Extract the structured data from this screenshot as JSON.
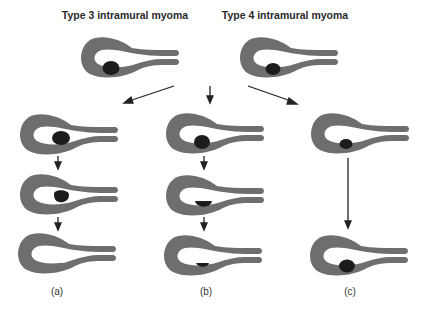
{
  "titles": {
    "type3": "Type 3 intramural myoma",
    "type4": "Type 4 intramural myoma"
  },
  "labels": {
    "a": "(a)",
    "b": "(b)",
    "c": "(c)"
  },
  "colors": {
    "uterus": "#6e6e6e",
    "myoma": "#1c1c1c",
    "arrow": "#222222",
    "background": "#ffffff"
  },
  "columns": [
    {
      "label": "(a)",
      "stages": [
        "intramural myoma",
        "myoma protruding into cavity",
        "cavity defect after myoma expulsion"
      ]
    },
    {
      "label": "(b)",
      "stages": [
        "myoma at cavity edge",
        "myoma partially in cavity",
        "small residual myoma in cavity"
      ]
    },
    {
      "label": "(c)",
      "stages": [
        "myoma at cavity edge",
        "myoma remains in wall"
      ]
    }
  ]
}
